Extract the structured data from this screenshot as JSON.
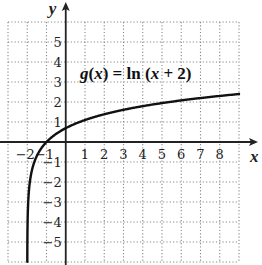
{
  "chart_data": {
    "type": "line",
    "title": "",
    "function_label": {
      "name": "g",
      "open": "(",
      "var": "x",
      "close": ")",
      "eq": " = ln (",
      "var2": "x",
      "rest": " + 2)"
    },
    "function_expression": "g(x) = ln(x + 2)",
    "xlabel": "x",
    "ylabel": "y",
    "xlim": [
      -3,
      9
    ],
    "ylim": [
      -6,
      6
    ],
    "grid": true,
    "grid_style": "dotted",
    "x_ticks": [
      -2,
      -1,
      1,
      2,
      3,
      4,
      5,
      6,
      7,
      8
    ],
    "y_ticks": [
      -5,
      -4,
      -3,
      -2,
      -1,
      1,
      2,
      3,
      4,
      5
    ],
    "series": [
      {
        "name": "g(x) = ln(x + 2)",
        "x": [
          -1.9975,
          -1.99,
          -1.98,
          -1.95,
          -1.9,
          -1.8,
          -1.7,
          -1.6,
          -1.5,
          -1.25,
          -1,
          -0.5,
          0,
          0.5,
          1,
          2,
          3,
          4,
          5,
          6,
          7,
          8,
          9
        ],
        "values": [
          -6,
          -4.61,
          -3.91,
          -3.0,
          -2.3,
          -1.61,
          -1.2,
          -0.92,
          -0.69,
          -0.29,
          0,
          0.41,
          0.69,
          0.92,
          1.1,
          1.39,
          1.61,
          1.79,
          1.95,
          2.08,
          2.2,
          2.3,
          2.4
        ]
      }
    ],
    "colors": {
      "curve": "#111111",
      "axis": "#222222",
      "grid": "#888888"
    }
  }
}
